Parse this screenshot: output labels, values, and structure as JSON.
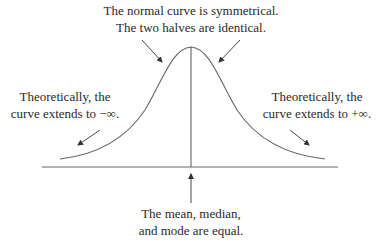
{
  "diagram": {
    "annotations": {
      "top": {
        "line1": "The normal curve is symmetrical.",
        "line2": "The two halves are identical."
      },
      "left": {
        "line1": "Theoretically, the",
        "line2": "curve extends to −∞."
      },
      "right": {
        "line1": "Theoretically, the",
        "line2": "curve extends to +∞."
      },
      "bottom": {
        "line1": "The mean, median,",
        "line2": "and mode are equal."
      }
    },
    "elements": {
      "curve": "normal-distribution-bell-curve",
      "baseline": "horizontal-axis",
      "center_line": "vertical-line-at-mean",
      "arrows": [
        "arrow-to-left-slope",
        "arrow-to-right-slope",
        "arrow-to-left-tail",
        "arrow-to-right-tail",
        "arrow-up-to-center"
      ]
    },
    "colors": {
      "line": "#555555",
      "text": "#2a2a2a",
      "background": "#ffffff"
    }
  }
}
